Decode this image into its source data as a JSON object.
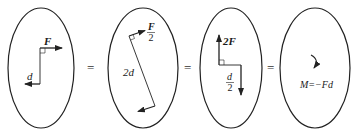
{
  "diagram": {
    "panels": [
      {
        "id": "panel-1",
        "force_label": "F",
        "distance_label": "d"
      },
      {
        "id": "panel-2",
        "force_num": "F",
        "force_den": "2",
        "distance_label": "2d"
      },
      {
        "id": "panel-3",
        "force_label": "2F",
        "distance_num": "d",
        "distance_den": "2"
      },
      {
        "id": "panel-4",
        "moment_label": "M=−Fd"
      }
    ],
    "equals": [
      "=",
      "=",
      "="
    ],
    "colors": {
      "stroke": "#222222",
      "background": "#ffffff"
    }
  }
}
